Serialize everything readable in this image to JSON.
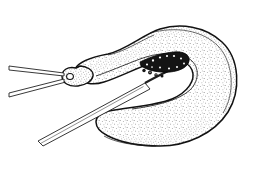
{
  "figure": {
    "title": "Endometrial biopsy",
    "title_color": "#2d2d2d",
    "background_color": "#ffffff",
    "ink_color": "#1a1a1a",
    "stipple_color": "#3b3b3b",
    "instrument_fill": "#ffffff",
    "device_dark_color": "#111111",
    "type": "medical-line-illustration"
  },
  "labels": {
    "title": "Endometrial biopsy"
  },
  "parts": {
    "uterus": "uterine-body-cross-section",
    "cervix": "cervix",
    "cervical_os": "cervical-os",
    "fundus": "uterine-fundus",
    "endometrium": "endometrial-cavity-lining",
    "myometrium": "myometrium-stippled-wall",
    "tenaculum_upper": "tenaculum-upper-arm",
    "tenaculum_lower": "tenaculum-lower-arm",
    "catheter": "biopsy-catheter-shaft",
    "sampler_tip": "beaded-sampler-tip"
  }
}
